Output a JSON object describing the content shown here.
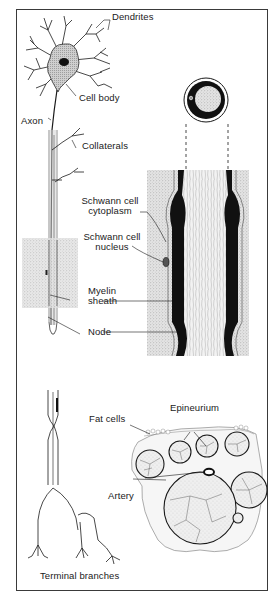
{
  "diagram": {
    "type": "anatomical-illustration",
    "colors": {
      "ink": "#1a1a1a",
      "stipple_bg": "#d9d9d9",
      "frame": "#3a3a3a",
      "paper": "#ffffff"
    },
    "labels": {
      "dendrites": "Dendrites",
      "cell_body": "Cell body",
      "axon": "Axon",
      "collaterals": "Collaterals",
      "schwann_cytoplasm_1": "Schwann cell",
      "schwann_cytoplasm_2": "cytoplasm",
      "schwann_nucleus_1": "Schwann cell",
      "schwann_nucleus_2": "nucleus",
      "myelin_1": "Myelin",
      "myelin_2": "sheath",
      "node": "Node",
      "fat_cells": "Fat cells",
      "epineurium": "Epineurium",
      "artery": "Artery",
      "terminal_branches": "Terminal branches"
    },
    "panels": [
      {
        "name": "whole-neuron",
        "description": "Neuron with dendrites, cell body, axon, collaterals and terminal branches"
      },
      {
        "name": "axon-cross-section",
        "description": "Circular cross-section of myelinated axon"
      },
      {
        "name": "myelinated-axon-enlarged",
        "description": "Enlarged longitudinal view showing myelin sheath, Schwann cell and node"
      },
      {
        "name": "nerve-cross-section",
        "description": "Cross-section of nerve with fascicles, fat cells, artery, epineurium"
      }
    ]
  }
}
